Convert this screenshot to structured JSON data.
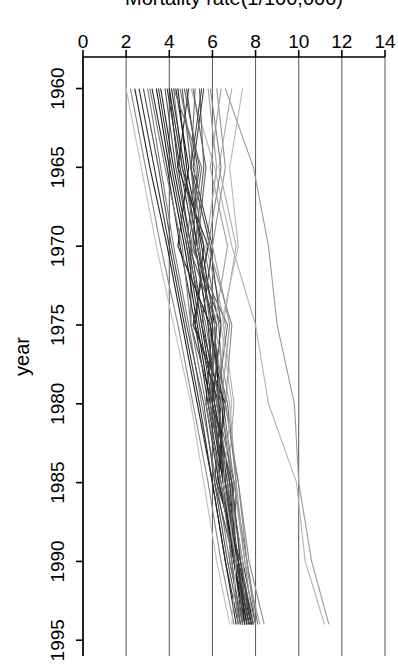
{
  "chart_data": {
    "type": "line",
    "title": "",
    "subtitle": "",
    "xlabel": "year",
    "ylabel": "Mortality rate(1/100,000)",
    "xlim": [
      1958,
      1996
    ],
    "ylim": [
      0,
      14
    ],
    "xticks": [
      1960,
      1965,
      1970,
      1975,
      1980,
      1985,
      1990,
      1995
    ],
    "yticks": [
      0,
      2,
      4,
      6,
      8,
      10,
      12,
      14
    ],
    "xtick_labels": [
      "1960",
      "1965",
      "1970",
      "1975",
      "1980",
      "1985",
      "1990",
      "1995"
    ],
    "ytick_labels": [
      "0",
      "2",
      "4",
      "6",
      "8",
      "10",
      "12",
      "14"
    ],
    "grid": "horizontal-gridlines-at-yticks",
    "legend": "none",
    "rotation_degrees": 90,
    "line_color_range": [
      "#111111",
      "#c8c8c8"
    ],
    "x": [
      1960,
      1965,
      1970,
      1975,
      1980,
      1985,
      1990,
      1994
    ],
    "series": [
      {
        "name": "region-01",
        "gray": "#9a9a9a",
        "values": [
          6.6,
          7.9,
          8.6,
          9.0,
          9.8,
          10.0,
          10.6,
          11.4
        ]
      },
      {
        "name": "region-02",
        "gray": "#b4b4b4",
        "values": [
          5.0,
          6.1,
          6.9,
          8.0,
          8.6,
          9.9,
          10.3,
          11.2
        ]
      },
      {
        "name": "region-03",
        "gray": "#8c8c8c",
        "values": [
          4.2,
          4.6,
          5.3,
          6.0,
          6.6,
          7.2,
          7.7,
          8.4
        ]
      },
      {
        "name": "region-04",
        "gray": "#3a3a3a",
        "values": [
          4.0,
          4.4,
          5.0,
          5.6,
          6.2,
          6.8,
          7.4,
          8.0
        ]
      },
      {
        "name": "region-05",
        "gray": "#202020",
        "values": [
          3.6,
          4.2,
          4.9,
          5.5,
          6.1,
          6.7,
          7.2,
          7.8
        ]
      },
      {
        "name": "region-06",
        "gray": "#585858",
        "values": [
          4.6,
          5.0,
          5.4,
          5.9,
          6.4,
          6.9,
          7.3,
          7.9
        ]
      },
      {
        "name": "region-07",
        "gray": "#6e6e6e",
        "values": [
          5.2,
          5.0,
          5.6,
          6.3,
          6.5,
          7.0,
          7.6,
          8.1
        ]
      },
      {
        "name": "region-08",
        "gray": "#2b2b2b",
        "values": [
          3.2,
          3.9,
          4.5,
          5.2,
          5.8,
          6.4,
          7.0,
          7.6
        ]
      },
      {
        "name": "region-09",
        "gray": "#474747",
        "values": [
          4.8,
          5.3,
          5.1,
          6.4,
          6.0,
          6.9,
          7.1,
          7.7
        ]
      },
      {
        "name": "region-10",
        "gray": "#7d7d7d",
        "values": [
          3.0,
          3.6,
          4.2,
          4.9,
          5.5,
          6.2,
          6.8,
          7.4
        ]
      },
      {
        "name": "region-11",
        "gray": "#1a1a1a",
        "values": [
          4.4,
          4.8,
          5.5,
          6.1,
          6.3,
          6.6,
          7.2,
          7.9
        ]
      },
      {
        "name": "region-12",
        "gray": "#616161",
        "values": [
          5.4,
          5.6,
          5.2,
          5.8,
          6.7,
          7.1,
          7.0,
          7.5
        ]
      },
      {
        "name": "region-13",
        "gray": "#343434",
        "values": [
          2.6,
          3.3,
          4.0,
          4.7,
          5.4,
          6.0,
          6.6,
          7.2
        ]
      },
      {
        "name": "region-14",
        "gray": "#a0a0a0",
        "values": [
          5.8,
          6.2,
          5.7,
          6.6,
          6.2,
          6.8,
          7.4,
          7.6
        ]
      },
      {
        "name": "region-15",
        "gray": "#4e4e4e",
        "values": [
          3.8,
          4.3,
          5.0,
          5.0,
          6.0,
          6.5,
          6.9,
          7.3
        ]
      },
      {
        "name": "region-16",
        "gray": "#272727",
        "values": [
          4.1,
          4.7,
          5.3,
          6.0,
          5.7,
          6.3,
          7.1,
          7.8
        ]
      },
      {
        "name": "region-17",
        "gray": "#888888",
        "values": [
          2.2,
          2.9,
          3.6,
          4.4,
          5.1,
          5.8,
          6.4,
          7.0
        ]
      },
      {
        "name": "region-18",
        "gray": "#3f3f3f",
        "values": [
          5.6,
          5.1,
          6.0,
          5.5,
          6.4,
          6.1,
          7.0,
          7.4
        ]
      },
      {
        "name": "region-19",
        "gray": "#707070",
        "values": [
          4.5,
          5.2,
          4.8,
          5.7,
          6.3,
          6.6,
          7.2,
          7.7
        ]
      },
      {
        "name": "region-20",
        "gray": "#151515",
        "values": [
          3.4,
          4.0,
          4.7,
          5.3,
          5.9,
          6.5,
          7.0,
          7.5
        ]
      },
      {
        "name": "region-21",
        "gray": "#959595",
        "values": [
          6.2,
          6.6,
          6.0,
          6.8,
          6.4,
          7.0,
          7.5,
          7.9
        ]
      },
      {
        "name": "region-22",
        "gray": "#525252",
        "values": [
          2.8,
          3.5,
          4.1,
          4.8,
          5.6,
          6.1,
          6.7,
          7.3
        ]
      },
      {
        "name": "region-23",
        "gray": "#2e2e2e",
        "values": [
          4.9,
          4.4,
          5.8,
          5.1,
          6.6,
          6.2,
          7.3,
          7.8
        ]
      },
      {
        "name": "region-24",
        "gray": "#acacac",
        "values": [
          6.9,
          6.3,
          7.1,
          6.5,
          7.0,
          6.7,
          7.4,
          7.6
        ]
      },
      {
        "name": "region-25",
        "gray": "#383838",
        "values": [
          3.9,
          4.5,
          5.2,
          5.8,
          6.1,
          6.8,
          7.1,
          7.7
        ]
      },
      {
        "name": "region-26",
        "gray": "#656565",
        "values": [
          5.1,
          5.7,
          5.3,
          6.2,
          5.9,
          6.6,
          7.2,
          7.4
        ]
      },
      {
        "name": "region-27",
        "gray": "#1f1f1f",
        "values": [
          4.3,
          4.9,
          4.4,
          5.9,
          6.5,
          6.3,
          7.1,
          7.6
        ]
      },
      {
        "name": "region-28",
        "gray": "#7a7a7a",
        "values": [
          3.1,
          3.8,
          4.6,
          5.0,
          5.7,
          6.4,
          6.9,
          7.2
        ]
      },
      {
        "name": "region-29",
        "gray": "#444444",
        "values": [
          5.5,
          5.0,
          5.9,
          6.4,
          6.0,
          6.9,
          7.3,
          7.8
        ]
      },
      {
        "name": "region-30",
        "gray": "#9f9f9f",
        "values": [
          6.4,
          5.9,
          6.7,
          6.1,
          6.8,
          7.1,
          7.5,
          8.2
        ]
      },
      {
        "name": "region-31",
        "gray": "#232323",
        "values": [
          2.4,
          3.1,
          3.9,
          4.6,
          5.3,
          6.0,
          6.6,
          7.1
        ]
      },
      {
        "name": "region-32",
        "gray": "#5c5c5c",
        "values": [
          4.7,
          5.4,
          4.9,
          6.2,
          5.8,
          6.7,
          7.0,
          7.9
        ]
      },
      {
        "name": "region-33",
        "gray": "#c0c0c0",
        "values": [
          2.0,
          2.7,
          3.4,
          4.2,
          5.0,
          5.6,
          6.2,
          6.8
        ]
      },
      {
        "name": "region-34",
        "gray": "#303030",
        "values": [
          4.0,
          4.6,
          5.6,
          5.2,
          6.3,
          6.5,
          7.2,
          7.5
        ]
      },
      {
        "name": "region-35",
        "gray": "#868686",
        "values": [
          5.9,
          6.4,
          5.8,
          6.9,
          6.6,
          7.2,
          7.6,
          8.0
        ]
      },
      {
        "name": "region-36",
        "gray": "#3d3d3d",
        "values": [
          3.5,
          4.1,
          4.8,
          5.4,
          6.0,
          6.6,
          7.1,
          7.7
        ]
      },
      {
        "name": "region-37",
        "gray": "#6a6a6a",
        "values": [
          4.2,
          5.5,
          5.0,
          6.7,
          6.2,
          7.0,
          6.8,
          7.4
        ]
      },
      {
        "name": "region-38",
        "gray": "#b8b8b8",
        "values": [
          7.4,
          6.8,
          7.2,
          6.4,
          6.9,
          6.5,
          7.1,
          6.9
        ]
      }
    ]
  }
}
